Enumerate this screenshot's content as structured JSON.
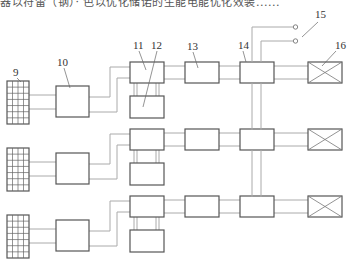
{
  "header": {
    "partial_text": "器以符雷（钢）· 色以优化储诺的生能电能优化效装......",
    "right_text": "· · · ·"
  },
  "diagram": {
    "labels": {
      "solar_panel": "9",
      "box_10": "10",
      "box_11": "11",
      "box_12": "12",
      "box_13": "13",
      "box_14": "14",
      "terminals": "15",
      "load": "16"
    },
    "row_count": 3,
    "row_offsets_px": [
      0,
      67,
      134
    ],
    "components": [
      {
        "id": "9",
        "kind": "solar-panel",
        "grid": "4x7"
      },
      {
        "id": "10",
        "kind": "block"
      },
      {
        "id": "11",
        "kind": "block"
      },
      {
        "id": "12",
        "kind": "block"
      },
      {
        "id": "13",
        "kind": "block"
      },
      {
        "id": "14",
        "kind": "block"
      },
      {
        "id": "15",
        "kind": "output-terminals",
        "count": 2
      },
      {
        "id": "16",
        "kind": "load-crossed-box"
      }
    ]
  }
}
